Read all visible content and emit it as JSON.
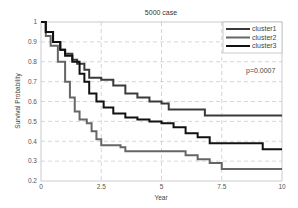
{
  "chart_data": {
    "type": "line",
    "title": "5000 case",
    "xlabel": "Year",
    "ylabel": "Survival Probability",
    "xlim": [
      0,
      10
    ],
    "ylim": [
      0.2,
      1
    ],
    "xticks": [
      0,
      2.5,
      5,
      7.5,
      10
    ],
    "xtick_labels": [
      "0",
      "2.5",
      "5",
      "7.5",
      "10"
    ],
    "yticks": [
      0.2,
      0.3,
      0.4,
      0.5,
      0.6,
      0.7,
      0.8,
      0.9,
      1
    ],
    "ytick_labels": [
      "0.2",
      "0.3",
      "0.4",
      "0.5",
      "0.6",
      "0.7",
      "0.8",
      "0.9",
      "1"
    ],
    "grid": true,
    "legend_position": "upper right",
    "annotation": "p=0.0007",
    "series": [
      {
        "name": "cluster1",
        "color": "#3a3a3a",
        "step": true,
        "x": [
          0,
          0.2,
          0.5,
          0.8,
          1.0,
          1.3,
          1.5,
          1.8,
          2.0,
          2.5,
          3.0,
          3.5,
          4.0,
          4.5,
          5.0,
          5.3,
          6.6,
          6.8,
          10
        ],
        "y": [
          1.0,
          0.95,
          0.9,
          0.86,
          0.84,
          0.81,
          0.79,
          0.76,
          0.72,
          0.71,
          0.68,
          0.64,
          0.62,
          0.6,
          0.59,
          0.56,
          0.56,
          0.53,
          0.53
        ]
      },
      {
        "name": "cluster2",
        "color": "#666666",
        "step": true,
        "x": [
          0,
          0.2,
          0.4,
          0.7,
          1.0,
          1.2,
          1.4,
          1.6,
          1.9,
          2.1,
          2.3,
          2.5,
          3.3,
          3.5,
          5.5,
          6.0,
          6.5,
          7.0,
          7.5,
          10
        ],
        "y": [
          1.0,
          0.93,
          0.88,
          0.8,
          0.7,
          0.62,
          0.55,
          0.51,
          0.49,
          0.45,
          0.41,
          0.38,
          0.37,
          0.35,
          0.35,
          0.33,
          0.31,
          0.29,
          0.26,
          0.26
        ]
      },
      {
        "name": "cluster3",
        "color": "#111111",
        "step": true,
        "x": [
          0,
          0.2,
          0.5,
          0.8,
          1.0,
          1.3,
          1.6,
          1.8,
          2.0,
          2.3,
          2.6,
          3.0,
          3.5,
          4.0,
          4.5,
          5.0,
          5.5,
          6.0,
          6.5,
          7.0,
          9.1,
          9.2,
          10
        ],
        "y": [
          1.0,
          0.95,
          0.9,
          0.86,
          0.83,
          0.8,
          0.74,
          0.7,
          0.64,
          0.6,
          0.57,
          0.54,
          0.52,
          0.51,
          0.5,
          0.49,
          0.47,
          0.44,
          0.42,
          0.39,
          0.39,
          0.36,
          0.36
        ]
      }
    ]
  }
}
